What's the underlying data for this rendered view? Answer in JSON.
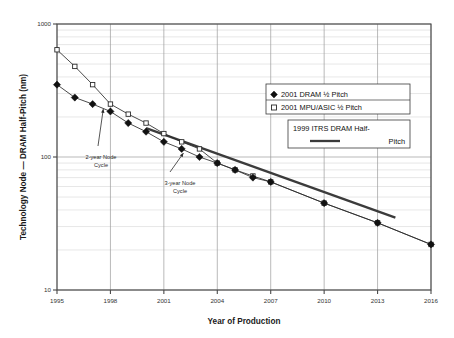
{
  "chart_data": {
    "type": "line",
    "title": "",
    "xlabel": "Year of Production",
    "ylabel": "Technology Node — DRAM Half-Pitch (nm)",
    "xlim": [
      1995,
      2016
    ],
    "ylim": [
      10,
      1000
    ],
    "yscale": "log",
    "grid": true,
    "legend_position": "right-top",
    "xticks": [
      "1995",
      "1998",
      "2001",
      "2004",
      "2007",
      "2010",
      "2013",
      "2016"
    ],
    "xtick_values": [
      1995,
      1998,
      2001,
      2004,
      2007,
      2010,
      2013,
      2016
    ],
    "yticks": [
      "1000",
      "100",
      "10"
    ],
    "ytick_values": [
      1000,
      100,
      10
    ],
    "series": [
      {
        "name": "2001 DRAM ½ Pitch",
        "marker": "filled-diamond",
        "x": [
          1995,
          1996,
          1997,
          1998,
          1999,
          2000,
          2001,
          2002,
          2003,
          2004,
          2005,
          2006,
          2007,
          2010,
          2013,
          2016
        ],
        "values": [
          350,
          280,
          250,
          220,
          180,
          155,
          130,
          115,
          100,
          90,
          80,
          70,
          65,
          45,
          32,
          22
        ]
      },
      {
        "name": "2001 MPU/ASIC ½ Pitch",
        "marker": "open-square",
        "x": [
          1995,
          1996,
          1997,
          1998,
          1999,
          2000,
          2001,
          2002,
          2003,
          2004,
          2005,
          2006,
          2007,
          2010,
          2013,
          2016
        ],
        "values": [
          640,
          480,
          350,
          250,
          210,
          180,
          150,
          130,
          115,
          90,
          80,
          72,
          65,
          45,
          32,
          22
        ]
      },
      {
        "name": "1999 ITRS DRAM Half-Pitch",
        "marker": "thick-line",
        "x": [
          2000,
          2014
        ],
        "values": [
          165,
          35
        ]
      }
    ],
    "annotations": [
      {
        "label": "2-year Node Cycle",
        "target_x": 1997.6,
        "target_y": 230
      },
      {
        "label": "3-year Node Cycle",
        "target_x": 2002.1,
        "target_y": 107
      }
    ]
  },
  "legend": {
    "entries": [
      {
        "label": "2001 DRAM ½ Pitch",
        "marker": "filled-diamond"
      },
      {
        "label": "2001 MPU/ASIC ½ Pitch",
        "marker": "open-square"
      }
    ],
    "itrs_label_line1": "1999 ITRS DRAM Half-",
    "itrs_label_line2": "Pitch"
  },
  "annotations": {
    "two_year_line1": "2-year  Node",
    "two_year_line2": "Cycle",
    "three_year_line1": "3-year  Node",
    "three_year_line2": "Cycle"
  },
  "colors": {
    "axis": "#4a4a4a",
    "grid_major": "#9b9b9b",
    "grid_minor": "#c9c9c9",
    "marker_fill": "#111111",
    "background": "#ffffff"
  }
}
